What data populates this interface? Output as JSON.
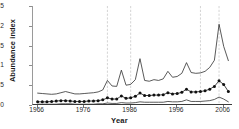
{
  "chart_data": {
    "type": "line",
    "title": "",
    "xlabel": "Year",
    "ylabel": "Abundance index",
    "xlim": [
      1965,
      2008
    ],
    "ylim": [
      0,
      2.5
    ],
    "grid": false,
    "legend": "none",
    "y_ticks": [
      "0",
      "0.5",
      "1",
      "1.5",
      "2",
      "2.5"
    ],
    "y_tick_values": [
      0,
      0.5,
      1,
      1.5,
      2,
      2.5
    ],
    "x_ticks": [
      "1966",
      "1976",
      "1986",
      "1996",
      "2006"
    ],
    "x_tick_values": [
      1966,
      1976,
      1986,
      1996,
      2006
    ],
    "annotations": {
      "vertical_dashed_lines": [
        1981,
        1986,
        2001,
        2005
      ]
    },
    "x": [
      1966,
      1967,
      1968,
      1969,
      1970,
      1971,
      1972,
      1973,
      1974,
      1975,
      1976,
      1977,
      1978,
      1979,
      1980,
      1981,
      1982,
      1983,
      1984,
      1985,
      1986,
      1987,
      1988,
      1989,
      1990,
      1991,
      1992,
      1993,
      1994,
      1995,
      1996,
      1997,
      1998,
      1999,
      2000,
      2001,
      2002,
      2003,
      2004,
      2005,
      2006,
      2007
    ],
    "series": [
      {
        "name": "Upper confidence limit",
        "style": "thin-line",
        "values": [
          0.3,
          0.29,
          0.28,
          0.27,
          0.28,
          0.31,
          0.34,
          0.31,
          0.28,
          0.28,
          0.29,
          0.3,
          0.31,
          0.33,
          0.38,
          0.62,
          0.48,
          0.47,
          0.88,
          0.5,
          0.52,
          0.64,
          1.17,
          0.62,
          0.6,
          0.64,
          0.62,
          0.66,
          0.85,
          0.7,
          0.72,
          0.8,
          1.07,
          0.82,
          0.8,
          0.81,
          0.85,
          0.95,
          1.13,
          2.04,
          1.48,
          1.12
        ]
      },
      {
        "name": "Abundance index",
        "style": "markers-line",
        "values": [
          0.08,
          0.08,
          0.08,
          0.09,
          0.1,
          0.11,
          0.11,
          0.1,
          0.09,
          0.09,
          0.09,
          0.1,
          0.1,
          0.11,
          0.13,
          0.18,
          0.15,
          0.15,
          0.23,
          0.17,
          0.18,
          0.22,
          0.3,
          0.24,
          0.24,
          0.25,
          0.25,
          0.26,
          0.31,
          0.28,
          0.29,
          0.32,
          0.4,
          0.33,
          0.33,
          0.34,
          0.36,
          0.4,
          0.47,
          0.61,
          0.52,
          0.34
        ]
      },
      {
        "name": "Lower confidence limit",
        "style": "thin-line",
        "values": [
          0.02,
          0.02,
          0.02,
          0.02,
          0.02,
          0.03,
          0.03,
          0.03,
          0.02,
          0.02,
          0.02,
          0.02,
          0.02,
          0.03,
          0.03,
          0.05,
          0.04,
          0.04,
          0.06,
          0.05,
          0.05,
          0.06,
          0.08,
          0.07,
          0.07,
          0.07,
          0.07,
          0.07,
          0.09,
          0.08,
          0.08,
          0.09,
          0.13,
          0.09,
          0.09,
          0.09,
          0.1,
          0.11,
          0.14,
          0.2,
          0.15,
          0.08
        ]
      }
    ]
  }
}
